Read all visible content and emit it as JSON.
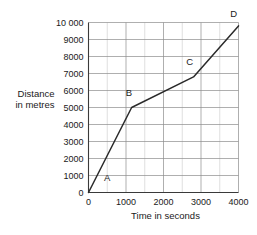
{
  "chart_data": {
    "type": "line",
    "title": "",
    "xlabel": "Time in seconds",
    "ylabel_line1": "Distance",
    "ylabel_line2": "in metres",
    "xlim": [
      0,
      4000
    ],
    "ylim": [
      0,
      10000
    ],
    "grid": true,
    "legend": "none",
    "x_ticks": [
      "0",
      "1000",
      "2000",
      "3000",
      "4000"
    ],
    "x_tick_values": [
      0,
      1000,
      2000,
      3000,
      4000
    ],
    "x_minor_step": 500,
    "y_ticks": [
      "0",
      "1000",
      "2000",
      "3000",
      "4000",
      "5000",
      "6000",
      "7000",
      "8000",
      "9000",
      "10 000"
    ],
    "y_tick_values": [
      0,
      1000,
      2000,
      3000,
      4000,
      5000,
      6000,
      7000,
      8000,
      9000,
      10000
    ],
    "series": [
      {
        "name": "journey",
        "x": [
          0,
          1150,
          2800,
          4000
        ],
        "values": [
          0,
          5000,
          6800,
          9800
        ]
      }
    ],
    "annotations": [
      {
        "label": "A",
        "x": 500,
        "y": 700
      },
      {
        "label": "B",
        "x": 1080,
        "y": 5700
      },
      {
        "label": "C",
        "x": 2700,
        "y": 7500
      },
      {
        "label": "D",
        "x": 3870,
        "y": 10300
      }
    ],
    "colors": {
      "line": "#2a2a2a",
      "grid_major": "#8d8d8d",
      "grid_minor": "#c9c9c9",
      "axis": "#3a3a3a",
      "background": "#ffffff",
      "text": "#1a1a1a"
    }
  }
}
